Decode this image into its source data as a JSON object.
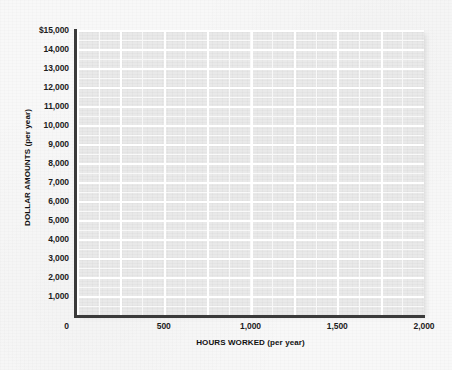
{
  "chart_data": {
    "type": "scatter",
    "title": "",
    "subtitle": "",
    "xlabel": "HOURS WORKED (per year)",
    "ylabel": "DOLLAR AMOUNTS (per year)",
    "xlim": [
      0,
      2000
    ],
    "ylim": [
      0,
      15000
    ],
    "x_ticks": [
      0,
      500,
      1000,
      1500,
      2000
    ],
    "x_tick_labels": [
      "0",
      "500",
      "1,000",
      "1,500",
      "2,000"
    ],
    "y_ticks": [
      1000,
      2000,
      3000,
      4000,
      5000,
      6000,
      7000,
      8000,
      9000,
      10000,
      11000,
      12000,
      13000,
      14000,
      15000
    ],
    "y_tick_labels": [
      "1,000",
      "2,000",
      "3,000",
      "4,000",
      "5,000",
      "6,000",
      "7,000",
      "8,000",
      "9,000",
      "10,000",
      "11,000",
      "12,000",
      "13,000",
      "14,000",
      "$15,000"
    ],
    "origin_label": "0",
    "grid": true,
    "grid_style": "white gridlines on light gray panel",
    "grid_major_x_step": 250,
    "grid_major_y_step": 1000,
    "grid_minor_x_step": 125,
    "grid_minor_y_step": 500,
    "legend": false,
    "legend_position": "none",
    "series": [],
    "values": [],
    "categories": [],
    "annotations": [],
    "note": "Empty blank graph grid; no data points, lines or bars are plotted."
  },
  "colors": {
    "page_background": "#f8f8f8",
    "plot_panel": "#e9e9e9",
    "gridline": "#ffffff",
    "axis_line": "#3a3a3a",
    "tick_label": "#1c1c1c",
    "axis_title": "#111111"
  }
}
